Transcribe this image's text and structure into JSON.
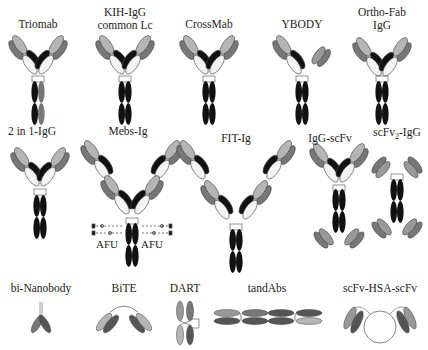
{
  "colors": {
    "dark": "#111111",
    "mid": "#777777",
    "light": "#b5b5b5",
    "white": "#f4f4f4",
    "stroke": "#444444"
  },
  "rows": [
    {
      "formats": [
        {
          "id": "triomab",
          "label": "Triomab",
          "x": 38,
          "y": 18
        },
        {
          "id": "kih-igg",
          "label": "KIH-IgG",
          "label2": "common Lc",
          "x": 125,
          "y": 6
        },
        {
          "id": "crossmab",
          "label": "CrossMab",
          "x": 209,
          "y": 18
        },
        {
          "id": "ybody",
          "label": "YBODY",
          "x": 302,
          "y": 18
        },
        {
          "id": "ortho-fab",
          "label": "Ortho-Fab",
          "label2": "IgG",
          "x": 382,
          "y": 6
        }
      ]
    },
    {
      "formats": [
        {
          "id": "2in1-igg",
          "label": "2 in 1-IgG",
          "x": 32,
          "y": 125
        },
        {
          "id": "mebs-ig",
          "label": "Mebs-Ig",
          "x": 128,
          "y": 125
        },
        {
          "id": "fit-ig",
          "label": "FIT-Ig",
          "x": 236,
          "y": 132
        },
        {
          "id": "igg-scfv",
          "label": "IgG-scFv",
          "x": 330,
          "y": 132
        },
        {
          "id": "scfv2-igg",
          "label_main": "scFv",
          "label_sub": "2",
          "label_tail": "-IgG",
          "x": 397,
          "y": 126
        }
      ],
      "annotations": [
        {
          "id": "afu-left",
          "text": "AFU",
          "x": 107,
          "y": 244
        },
        {
          "id": "afu-right",
          "text": "AFU",
          "x": 152,
          "y": 244
        }
      ]
    },
    {
      "formats": [
        {
          "id": "bi-nanobody",
          "label": "bi-Nanobody",
          "x": 41,
          "y": 282
        },
        {
          "id": "bite",
          "label": "BiTE",
          "x": 124,
          "y": 282
        },
        {
          "id": "dart",
          "label": "DART",
          "x": 185,
          "y": 282
        },
        {
          "id": "tandabs",
          "label": "tandAbs",
          "x": 267,
          "y": 282
        },
        {
          "id": "scfv-hsa-scfv",
          "label": "scFv-HSA-scFv",
          "x": 380,
          "y": 282
        }
      ]
    }
  ]
}
